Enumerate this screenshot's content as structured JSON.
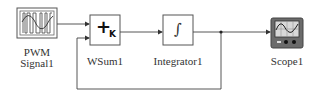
{
  "diagram": {
    "blocks": [
      {
        "id": "pwm",
        "label_line1": "PWM",
        "label_line2": "Signal1",
        "icon": "pwm-waveform-icon"
      },
      {
        "id": "wsum",
        "label": "WSum1",
        "symbol": "+",
        "subscript": "K",
        "icon": "weighted-sum-icon"
      },
      {
        "id": "integrator",
        "label": "Integrator1",
        "symbol": "∫",
        "icon": "integral-icon"
      },
      {
        "id": "scope",
        "label": "Scope1",
        "icon": "oscilloscope-icon"
      }
    ],
    "connections": [
      {
        "from": "pwm",
        "to": "wsum",
        "port": 1
      },
      {
        "from": "wsum",
        "to": "integrator"
      },
      {
        "from": "integrator",
        "to": "scope"
      },
      {
        "from": "integrator",
        "to": "wsum",
        "port": 2,
        "type": "feedback"
      }
    ],
    "colors": {
      "line": "#444444",
      "block_border": "#555555",
      "scope_body": "#6b6b6b",
      "scope_screen": "#d8d8d8"
    }
  }
}
